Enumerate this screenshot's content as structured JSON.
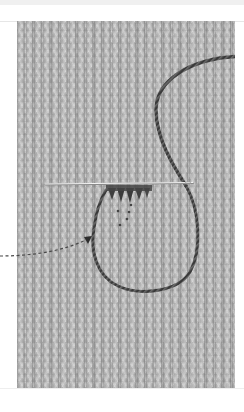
{
  "figure": {
    "photo_colors": {
      "fabric": "#b9b9b9",
      "yarn": "#3c3c3c",
      "needle": "#efefef",
      "arrow": "#555555",
      "page_background": "#ffffff",
      "top_band": "#f0f0f0"
    },
    "annotations": {
      "arrow": {
        "style": "dashed",
        "direction": "points-right-up",
        "target": "yarn-loop-left-side"
      }
    }
  }
}
